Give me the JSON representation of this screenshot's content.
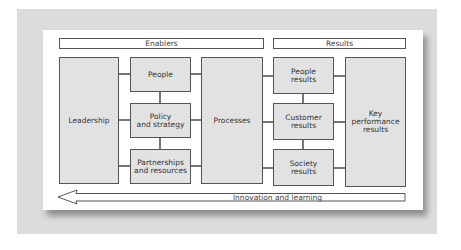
{
  "diagram": {
    "headers": {
      "enablers": "Enablers",
      "results": "Results"
    },
    "boxes": {
      "leadership": "Leadership",
      "people": "People",
      "policy_strategy": "Policy\nand strategy",
      "partnerships_resources": "Partnerships\nand resources",
      "processes": "Processes",
      "people_results": "People\nresults",
      "customer_results": "Customer\nresults",
      "society_results": "Society\nresults",
      "key_performance_results": "Key\nperformance\nresults"
    },
    "arrow": {
      "label": "Innovation and learning",
      "direction": "left"
    },
    "colors": {
      "box_fill": "#e2e2e2",
      "border": "#555555",
      "background": "#dcdcdc",
      "paper": "#ffffff"
    }
  }
}
